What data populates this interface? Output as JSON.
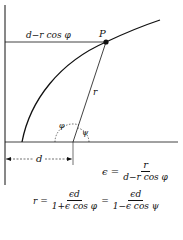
{
  "diagram": {
    "title": "",
    "labels": {
      "horizontal_segment": "d−r  cos  φ",
      "point": "P",
      "radius": "r",
      "angle_phi": "φ",
      "angle_psi": "ψ",
      "distance": "d"
    },
    "equations": {
      "eccentricity": {
        "lhs": "ϵ =",
        "numerator": "r",
        "denominator": "d−r  cos  φ"
      },
      "radius": {
        "lhs": "r =",
        "frac1_numerator": "ϵd",
        "frac1_denominator": "1+ϵ  cos  φ",
        "equals": "=",
        "frac2_numerator": "ϵd",
        "frac2_denominator": "1−ϵ  cos  ψ"
      }
    },
    "colors": {
      "stroke": "#111111",
      "background": "#ffffff"
    }
  }
}
